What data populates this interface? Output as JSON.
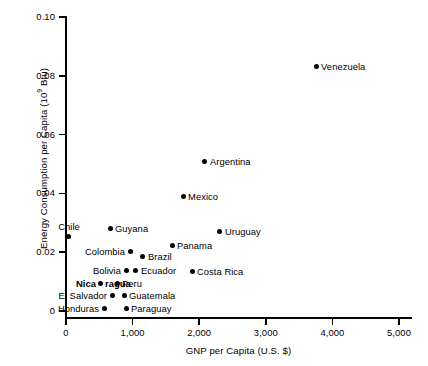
{
  "chart_data": {
    "type": "scatter",
    "title": "",
    "xlabel": "GNP per Capita (U.S. $)",
    "ylabel": "Energy Consumption per Capita (10⁹ Btu)",
    "ylabel_main": "Energy Consumption per Capita (10",
    "ylabel_sup": "9",
    "ylabel_tail": " Btu)",
    "xlim": [
      0,
      5000
    ],
    "ylim": [
      0,
      0.1
    ],
    "grid": false,
    "legend": null,
    "x_ticks": [
      0,
      1000,
      2000,
      3000,
      4000,
      5000
    ],
    "x_tick_labels": [
      "0",
      "1,000",
      "2,000",
      "3,000",
      "4,000",
      "5,000"
    ],
    "y_ticks": [
      0,
      0.02,
      0.04,
      0.06,
      0.08,
      0.1
    ],
    "y_tick_labels": [
      "0",
      "0.02",
      "0.04",
      "0.06",
      "0.08",
      "0.10"
    ],
    "points": [
      {
        "name": "Venezuela",
        "x": 3755,
        "y": 0.083,
        "label_pos": "right"
      },
      {
        "name": "Argentina",
        "x": 2087,
        "y": 0.0507,
        "label_pos": "right"
      },
      {
        "name": "Mexico",
        "x": 1757,
        "y": 0.0391,
        "label_pos": "right"
      },
      {
        "name": "Uruguay",
        "x": 2312,
        "y": 0.0269,
        "label_pos": "right"
      },
      {
        "name": "Guyana",
        "x": 661,
        "y": 0.0282,
        "label_pos": "right"
      },
      {
        "name": "Chile",
        "x": 45,
        "y": 0.0255,
        "label_pos": "above"
      },
      {
        "name": "Panama",
        "x": 1592,
        "y": 0.0224,
        "label_pos": "right"
      },
      {
        "name": "Colombia",
        "x": 961,
        "y": 0.0204,
        "label_pos": "left"
      },
      {
        "name": "Brazil",
        "x": 1156,
        "y": 0.0187,
        "label_pos": "right"
      },
      {
        "name": "Bolivia",
        "x": 901,
        "y": 0.0139,
        "label_pos": "left"
      },
      {
        "name": "Ecuador",
        "x": 1051,
        "y": 0.0139,
        "label_pos": "right"
      },
      {
        "name": "Costa Rica",
        "x": 1892,
        "y": 0.0136,
        "label_pos": "right"
      },
      {
        "name": "Nicaragua",
        "x": 511,
        "y": 0.0095,
        "label_pos": "split",
        "label_part1": "Nica",
        "label_part2": "ragua"
      },
      {
        "name": "Peru",
        "x": 766,
        "y": 0.0095,
        "label_pos": "right"
      },
      {
        "name": "El Salvador",
        "x": 691,
        "y": 0.0054,
        "label_pos": "left"
      },
      {
        "name": "Guatemala",
        "x": 871,
        "y": 0.0054,
        "label_pos": "right"
      },
      {
        "name": "Honduras",
        "x": 571,
        "y": 0.001,
        "label_pos": "left"
      },
      {
        "name": "Paraguay",
        "x": 901,
        "y": 0.001,
        "label_pos": "right"
      }
    ]
  }
}
